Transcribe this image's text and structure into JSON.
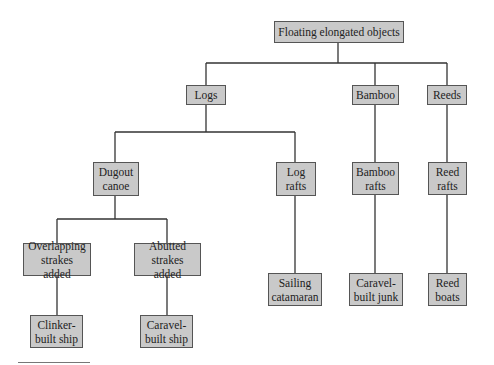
{
  "diagram": {
    "title": "Floating elongated objects",
    "nodes": {
      "root": "Floating elongated objects",
      "logs": "Logs",
      "bamboo": "Bamboo",
      "reeds": "Reeds",
      "dugout_canoe": "Dugout\ncanoe",
      "log_rafts": "Log\nrafts",
      "bamboo_rafts": "Bamboo\nrafts",
      "reed_rafts": "Reed\nrafts",
      "overlapping_strakes": "Overlapping\nstrakes added",
      "abutted_strakes": "Abutted\nstrakes added",
      "clinker_built_ship": "Clinker-\nbuilt ship",
      "caravel_built_ship": "Caravel-\nbuilt ship",
      "sailing_catamaran": "Sailing\ncatamaran",
      "caravel_built_junk": "Caravel-\nbuilt junk",
      "reed_boats": "Reed\nboats"
    },
    "edges": [
      [
        "root",
        "logs"
      ],
      [
        "root",
        "bamboo"
      ],
      [
        "root",
        "reeds"
      ],
      [
        "logs",
        "dugout_canoe"
      ],
      [
        "logs",
        "log_rafts"
      ],
      [
        "bamboo",
        "bamboo_rafts"
      ],
      [
        "reeds",
        "reed_rafts"
      ],
      [
        "dugout_canoe",
        "overlapping_strakes"
      ],
      [
        "dugout_canoe",
        "abutted_strakes"
      ],
      [
        "overlapping_strakes",
        "clinker_built_ship"
      ],
      [
        "abutted_strakes",
        "caravel_built_ship"
      ],
      [
        "log_rafts",
        "sailing_catamaran"
      ],
      [
        "bamboo_rafts",
        "caravel_built_junk"
      ],
      [
        "reed_rafts",
        "reed_boats"
      ]
    ],
    "colors": {
      "node_fill": "#c9c9c9",
      "node_border": "#555555",
      "line": "#333333"
    }
  }
}
